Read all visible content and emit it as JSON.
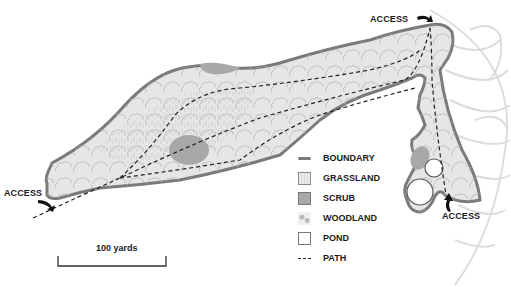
{
  "map": {
    "access_labels": [
      "ACCESS",
      "ACCESS",
      "ACCESS"
    ],
    "scale_bar": {
      "label": "100 yards"
    },
    "colors": {
      "boundary": "#7a7a7a",
      "grassland": "#e8e8e8",
      "scrub": "#a8a8a8",
      "woodland": "#eeeeee",
      "pond": "#ffffff",
      "path": "#222222",
      "background_leaf": "#dcdcdc"
    }
  },
  "legend": {
    "items": [
      {
        "label": "BOUNDARY",
        "icon": "boundary-line"
      },
      {
        "label": "GRASSLAND",
        "icon": "grassland-swatch"
      },
      {
        "label": "SCRUB",
        "icon": "scrub-swatch"
      },
      {
        "label": "WOODLAND",
        "icon": "woodland-swatch"
      },
      {
        "label": "POND",
        "icon": "pond-swatch"
      },
      {
        "label": "PATH",
        "icon": "path-dashed-line"
      }
    ]
  }
}
